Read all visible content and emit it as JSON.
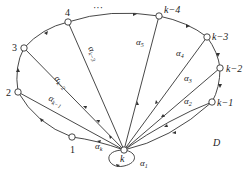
{
  "diagram": {
    "type": "directed-cycle-graph",
    "region_label": "D",
    "center_node": {
      "id": "k",
      "label": "k"
    },
    "ring_nodes": [
      {
        "id": "1",
        "label": "1"
      },
      {
        "id": "2",
        "label": "2"
      },
      {
        "id": "3",
        "label": "3"
      },
      {
        "id": "4",
        "label": "4"
      },
      {
        "id": "dots",
        "label": "···"
      },
      {
        "id": "k-4",
        "label": "k−4"
      },
      {
        "id": "k-3",
        "label": "k−3"
      },
      {
        "id": "k-2",
        "label": "k−2"
      },
      {
        "id": "k-1",
        "label": "k−1"
      }
    ],
    "spoke_labels": {
      "loop": {
        "base": "α",
        "sub": "1"
      },
      "k-1": {
        "base": "α",
        "sub": "2"
      },
      "k-2": {
        "base": "α",
        "sub": "3"
      },
      "k-3": {
        "base": "α",
        "sub": "4"
      },
      "k-4": {
        "base": "α",
        "sub": "5"
      },
      "4": {
        "base": "α",
        "sub": "k−3"
      },
      "3": {
        "base": "α",
        "sub": "k−2"
      },
      "2": {
        "base": "α",
        "sub": "k−1"
      },
      "1": {
        "base": "α",
        "sub": "k"
      }
    }
  }
}
